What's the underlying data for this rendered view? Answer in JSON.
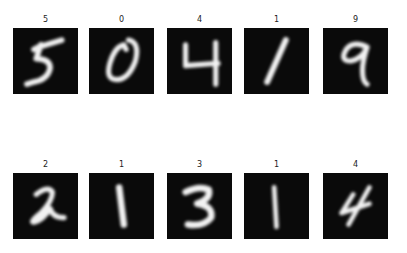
{
  "figure": {
    "rows": 2,
    "cols": 5,
    "colormap": "gray",
    "background": "#ffffff",
    "panels": [
      {
        "title": "5",
        "digit": "5"
      },
      {
        "title": "0",
        "digit": "0"
      },
      {
        "title": "4",
        "digit": "4"
      },
      {
        "title": "1",
        "digit": "1"
      },
      {
        "title": "9",
        "digit": "9"
      },
      {
        "title": "2",
        "digit": "2"
      },
      {
        "title": "1",
        "digit": "1"
      },
      {
        "title": "3",
        "digit": "3"
      },
      {
        "title": "1",
        "digit": "1"
      },
      {
        "title": "4",
        "digit": "4"
      }
    ]
  }
}
